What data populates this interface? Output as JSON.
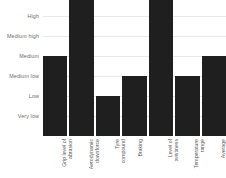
{
  "chart_data": {
    "type": "bar",
    "title": "",
    "subtitle": "",
    "xlabel": "",
    "ylabel": "",
    "grid": true,
    "legend": "none",
    "orientation": "vertical",
    "bar_color": "#1f1f1f",
    "grid_color": "#e9e9e9",
    "background": "#ffffff",
    "axis_text_color": "#6e6e6e",
    "y_axis_type": "ordinal",
    "y_levels": [
      "Very low",
      "Low",
      "Medium low",
      "Medium",
      "Medium high",
      "High",
      "Very high"
    ],
    "ylim": [
      0,
      7
    ],
    "categories": [
      "Grip level of abrasion",
      "Aerodynamic downforce",
      "Tyre compound",
      "Braking",
      "Level of twistiness",
      "Temperature range",
      "Average speed"
    ],
    "category_lines": [
      [
        "Grip level of",
        "abrasion"
      ],
      [
        "Aerodynamic",
        "downforce"
      ],
      [
        "Tyre",
        "compound"
      ],
      [
        "Braking"
      ],
      [
        "Level of",
        "twistiness"
      ],
      [
        "Temperature",
        "range"
      ],
      [
        "Average",
        "speed"
      ]
    ],
    "value_labels": [
      "Medium",
      "Very high",
      "Low",
      "Medium low",
      "Very high",
      "Medium low",
      "Medium"
    ],
    "values": [
      4,
      7,
      2,
      3,
      7,
      3,
      4
    ]
  }
}
